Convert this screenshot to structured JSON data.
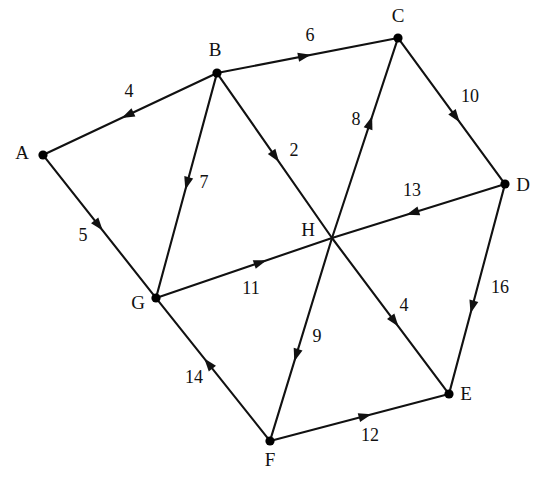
{
  "figure": {
    "type": "directed-weighted-graph",
    "background": "#ffffff",
    "ink_color": "#111111",
    "width": 547,
    "height": 477
  },
  "nodes": [
    {
      "id": "A",
      "label": "A",
      "x": 43,
      "y": 155,
      "label_x": 22,
      "label_y": 155,
      "has_dot": true
    },
    {
      "id": "B",
      "label": "B",
      "x": 217,
      "y": 73,
      "label_x": 215,
      "label_y": 52,
      "has_dot": true
    },
    {
      "id": "C",
      "label": "C",
      "x": 398,
      "y": 38,
      "label_x": 398,
      "label_y": 18,
      "has_dot": true
    },
    {
      "id": "D",
      "label": "D",
      "x": 505,
      "y": 184,
      "label_x": 523,
      "label_y": 187,
      "has_dot": true
    },
    {
      "id": "E",
      "label": "E",
      "x": 449,
      "y": 394,
      "label_x": 466,
      "label_y": 396,
      "has_dot": true
    },
    {
      "id": "F",
      "label": "F",
      "x": 270,
      "y": 441,
      "label_x": 270,
      "label_y": 462,
      "has_dot": true
    },
    {
      "id": "G",
      "label": "G",
      "x": 156,
      "y": 298,
      "label_x": 138,
      "label_y": 305,
      "has_dot": true
    },
    {
      "id": "H",
      "label": "H",
      "x": 332,
      "y": 238,
      "label_x": 308,
      "label_y": 232,
      "has_dot": false
    }
  ],
  "edges": [
    {
      "id": "B-A",
      "from": "B",
      "to": "A",
      "weight": "4",
      "label_x": 129,
      "label_y": 93,
      "arrow_t": 0.55
    },
    {
      "id": "B-C",
      "from": "B",
      "to": "C",
      "weight": "6",
      "label_x": 310,
      "label_y": 37,
      "arrow_t": 0.52
    },
    {
      "id": "C-D",
      "from": "C",
      "to": "D",
      "weight": "10",
      "label_x": 470,
      "label_y": 98,
      "arrow_t": 0.58
    },
    {
      "id": "A-G",
      "from": "A",
      "to": "G",
      "weight": "5",
      "label_x": 83,
      "label_y": 237,
      "arrow_t": 0.53
    },
    {
      "id": "B-G",
      "from": "B",
      "to": "G",
      "weight": "7",
      "label_x": 204,
      "label_y": 184,
      "arrow_t": 0.52
    },
    {
      "id": "B-H",
      "from": "B",
      "to": "H",
      "weight": "2",
      "label_x": 294,
      "label_y": 152,
      "arrow_t": 0.53
    },
    {
      "id": "H-C",
      "from": "H",
      "to": "C",
      "weight": "8",
      "label_x": 356,
      "label_y": 121,
      "arrow_t": 0.62
    },
    {
      "id": "D-H",
      "from": "D",
      "to": "H",
      "weight": "13",
      "label_x": 412,
      "label_y": 192,
      "arrow_t": 0.56
    },
    {
      "id": "G-H",
      "from": "G",
      "to": "H",
      "weight": "11",
      "label_x": 251,
      "label_y": 290,
      "arrow_t": 0.62
    },
    {
      "id": "H-E",
      "from": "H",
      "to": "E",
      "weight": "4",
      "label_x": 404,
      "label_y": 307,
      "arrow_t": 0.58
    },
    {
      "id": "H-F",
      "from": "H",
      "to": "F",
      "weight": "9",
      "label_x": 317,
      "label_y": 338,
      "arrow_t": 0.62
    },
    {
      "id": "D-E",
      "from": "D",
      "to": "E",
      "weight": "16",
      "label_x": 500,
      "label_y": 289,
      "arrow_t": 0.62
    },
    {
      "id": "F-G",
      "from": "F",
      "to": "G",
      "weight": "14",
      "label_x": 194,
      "label_y": 379,
      "arrow_t": 0.58
    },
    {
      "id": "F-E",
      "from": "F",
      "to": "E",
      "weight": "12",
      "label_x": 370,
      "label_y": 437,
      "arrow_t": 0.57
    }
  ]
}
